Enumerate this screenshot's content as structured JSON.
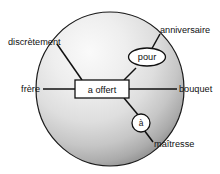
{
  "figure": {
    "type": "dependency-diagram",
    "language": "French",
    "background_color": "#ffffff",
    "sphere": {
      "name": "sphere-background",
      "fill_center": "#f2f2f2",
      "fill_edge": "#9a9a9a",
      "outline_color": "#111111",
      "cx": 110,
      "cy": 89,
      "rx": 74,
      "ry": 77
    },
    "predicate": {
      "label": "a offert",
      "shape": "rectangle",
      "fill": "#ffffff",
      "stroke": "#111111"
    },
    "prepositions": [
      {
        "label": "pour",
        "shape": "ellipse",
        "fill": "#ffffff",
        "stroke": "#111111"
      },
      {
        "label": "à",
        "shape": "circle",
        "fill": "#ffffff",
        "stroke": "#111111"
      }
    ],
    "arguments": [
      {
        "label": "discrètement",
        "position": "top-left"
      },
      {
        "label": "anniversaire",
        "position": "top-right"
      },
      {
        "label": "frère",
        "position": "left"
      },
      {
        "label": "bouquet",
        "position": "right"
      },
      {
        "label": "maîtresse",
        "position": "bottom-right"
      }
    ],
    "text_color": "#111111",
    "line_color": "#111111"
  }
}
